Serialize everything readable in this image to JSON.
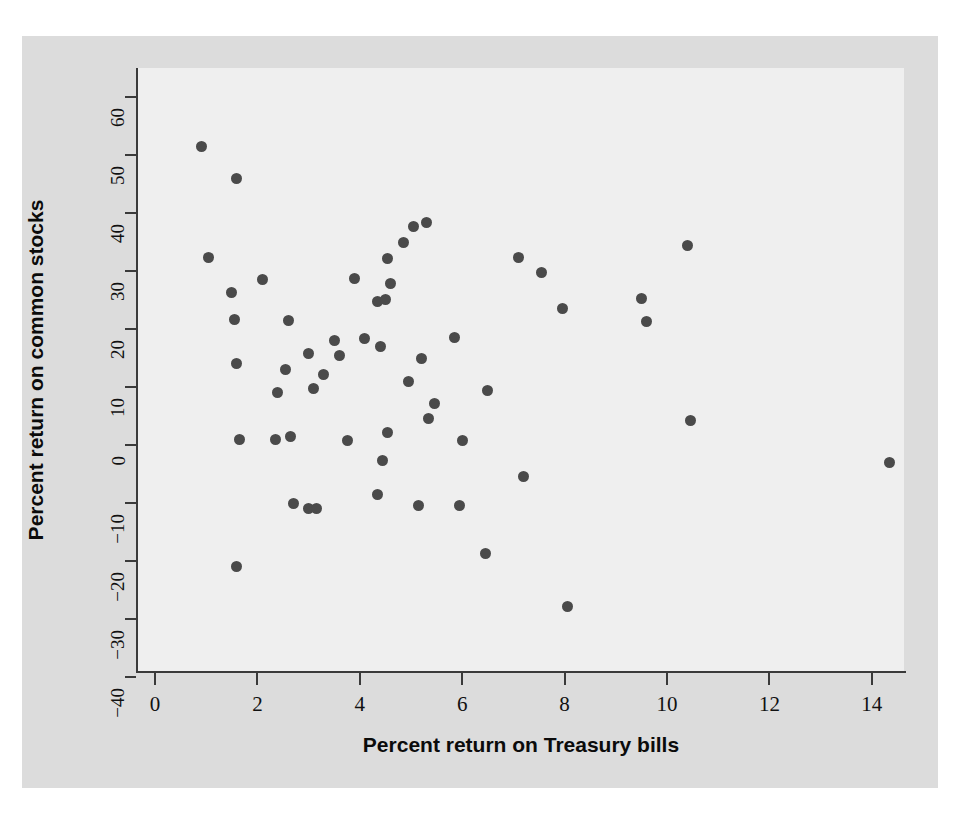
{
  "figure": {
    "background_color": "#dcdcdc",
    "panel_color": "#efefef",
    "point_color": "#4a4a4a",
    "axis_color": "#3a3a3a"
  },
  "chart_data": {
    "type": "scatter",
    "title": "",
    "xlabel": "Percent return on Treasury bills",
    "ylabel": "Percent return on common stocks",
    "xlim": [
      -0.4,
      15.1
    ],
    "ylim": [
      -44,
      64
    ],
    "xticks": [
      0,
      2,
      4,
      6,
      8,
      10,
      12,
      14
    ],
    "xticklabels": [
      "0",
      "2",
      "4",
      "6",
      "8",
      "10",
      "12",
      "14"
    ],
    "yticks": [
      60,
      50,
      40,
      30,
      20,
      10,
      0,
      -10,
      -20,
      -30,
      -40
    ],
    "yticklabels": [
      "60",
      "50",
      "40",
      "30",
      "20",
      "10",
      "0",
      "−10",
      "−20",
      "−30",
      "−40"
    ],
    "grid": false,
    "legend": null,
    "marker": "filled-circle",
    "n_points": 56,
    "points": [
      [
        0.9,
        51.5
      ],
      [
        1.6,
        46.0
      ],
      [
        1.05,
        32.3
      ],
      [
        1.5,
        26.3
      ],
      [
        1.55,
        21.6
      ],
      [
        2.1,
        28.5
      ],
      [
        1.6,
        14.0
      ],
      [
        1.65,
        0.9
      ],
      [
        1.6,
        -21.0
      ],
      [
        2.4,
        9.0
      ],
      [
        2.55,
        13.0
      ],
      [
        2.6,
        21.5
      ],
      [
        2.65,
        1.4
      ],
      [
        2.7,
        -10.0
      ],
      [
        3.0,
        -11.0
      ],
      [
        3.15,
        -11.0
      ],
      [
        3.1,
        9.8
      ],
      [
        3.0,
        15.8
      ],
      [
        3.3,
        12.1
      ],
      [
        3.6,
        15.5
      ],
      [
        3.5,
        18.0
      ],
      [
        3.9,
        28.7
      ],
      [
        3.75,
        0.8
      ],
      [
        4.1,
        18.4
      ],
      [
        4.35,
        24.8
      ],
      [
        4.5,
        25.1
      ],
      [
        4.4,
        16.9
      ],
      [
        4.6,
        27.8
      ],
      [
        4.55,
        32.2
      ],
      [
        4.85,
        35.0
      ],
      [
        5.05,
        37.6
      ],
      [
        5.3,
        38.4
      ],
      [
        5.2,
        14.9
      ],
      [
        4.95,
        11.0
      ],
      [
        4.35,
        -8.5
      ],
      [
        4.45,
        -2.6
      ],
      [
        4.55,
        2.1
      ],
      [
        5.15,
        -10.4
      ],
      [
        5.35,
        4.5
      ],
      [
        5.45,
        7.2
      ],
      [
        5.85,
        18.5
      ],
      [
        6.0,
        0.8
      ],
      [
        5.95,
        -10.5
      ],
      [
        6.45,
        -18.7
      ],
      [
        6.5,
        9.4
      ],
      [
        7.1,
        32.4
      ],
      [
        7.2,
        -5.5
      ],
      [
        7.55,
        29.8
      ],
      [
        7.95,
        23.6
      ],
      [
        8.05,
        -27.9
      ],
      [
        9.5,
        25.3
      ],
      [
        9.6,
        21.3
      ],
      [
        10.4,
        34.4
      ],
      [
        10.45,
        4.3
      ],
      [
        14.35,
        -3.1
      ],
      [
        2.35,
        0.9
      ]
    ]
  }
}
